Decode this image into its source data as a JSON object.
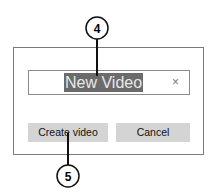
{
  "dialog": {
    "name_input": {
      "value": "New Video",
      "clear_icon": "close-icon",
      "clear_glyph": "×"
    },
    "buttons": {
      "create_label": "Create video",
      "cancel_label": "Cancel"
    }
  },
  "callouts": [
    {
      "number": "4",
      "target": "name-input"
    },
    {
      "number": "5",
      "target": "create-video-button"
    }
  ]
}
